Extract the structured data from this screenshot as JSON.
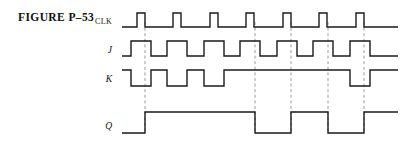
{
  "figure": {
    "caption": "FIGURE P–53",
    "background_color": "#ffffff",
    "wave_color": "#1a1a1a",
    "marker_color": "#9a9a9a",
    "width": 405,
    "height": 144
  },
  "signals": [
    {
      "name": "clk",
      "label": "CLK",
      "label_style": "upright",
      "label_x": 112,
      "label_y": 24
    },
    {
      "name": "j",
      "label": "J",
      "label_style": "italic",
      "label_x": 112,
      "label_y": 52
    },
    {
      "name": "k",
      "label": "K",
      "label_style": "italic",
      "label_x": 112,
      "label_y": 81
    },
    {
      "name": "q",
      "label": "Q",
      "label_style": "italic",
      "label_x": 112,
      "label_y": 128
    }
  ],
  "chart_data": {
    "type": "line",
    "subtitle": "JK flip-flop timing diagram",
    "xlabel": "",
    "ylabel": "",
    "grid": false,
    "legend_position": "left",
    "time_axis": {
      "x_start": 122,
      "x_end": 398,
      "clock_period_px": 36.4,
      "clock_pulse_width_px": 8,
      "first_clock_rise_px": 137
    },
    "levels": {
      "clk": {
        "low_y": 27,
        "high_y": 13
      },
      "j": {
        "low_y": 56,
        "high_y": 41
      },
      "k": {
        "low_y": 86,
        "high_y": 70
      },
      "q": {
        "low_y": 133,
        "high_y": 112
      }
    },
    "series": [
      {
        "name": "CLK",
        "description": "Eight narrow positive clock pulses, period 36.4 px, width 8 px",
        "transitions": [
          {
            "x": 122,
            "level": 0
          },
          {
            "x": 137,
            "level": 1
          },
          {
            "x": 145,
            "level": 0
          },
          {
            "x": 173,
            "level": 1
          },
          {
            "x": 181,
            "level": 0
          },
          {
            "x": 210,
            "level": 1
          },
          {
            "x": 218,
            "level": 0
          },
          {
            "x": 246,
            "level": 1
          },
          {
            "x": 254,
            "level": 0
          },
          {
            "x": 283,
            "level": 1
          },
          {
            "x": 291,
            "level": 0
          },
          {
            "x": 319,
            "level": 1
          },
          {
            "x": 327,
            "level": 0
          },
          {
            "x": 356,
            "level": 1
          },
          {
            "x": 364,
            "level": 0
          },
          {
            "x": 398,
            "level": 0
          }
        ]
      },
      {
        "name": "J",
        "description": "J pulses high across each clock edge except it stays low over the fourth, fifth and sixth edges region pattern",
        "transitions": [
          {
            "x": 122,
            "level": 0
          },
          {
            "x": 131,
            "level": 1
          },
          {
            "x": 151,
            "level": 0
          },
          {
            "x": 167,
            "level": 1
          },
          {
            "x": 187,
            "level": 0
          },
          {
            "x": 204,
            "level": 1
          },
          {
            "x": 224,
            "level": 0
          },
          {
            "x": 240,
            "level": 1
          },
          {
            "x": 260,
            "level": 0
          },
          {
            "x": 277,
            "level": 1
          },
          {
            "x": 297,
            "level": 0
          },
          {
            "x": 313,
            "level": 1
          },
          {
            "x": 333,
            "level": 0
          },
          {
            "x": 350,
            "level": 1
          },
          {
            "x": 370,
            "level": 0
          },
          {
            "x": 398,
            "level": 0
          }
        ]
      },
      {
        "name": "K",
        "description": "K starts high, three negative pulses at the first three clock edges, stays high, then one negative pulse at the last edge",
        "transitions": [
          {
            "x": 122,
            "level": 1
          },
          {
            "x": 131,
            "level": 0
          },
          {
            "x": 151,
            "level": 1
          },
          {
            "x": 167,
            "level": 0
          },
          {
            "x": 187,
            "level": 1
          },
          {
            "x": 204,
            "level": 0
          },
          {
            "x": 224,
            "level": 1
          },
          {
            "x": 350,
            "level": 0
          },
          {
            "x": 370,
            "level": 1
          },
          {
            "x": 398,
            "level": 1
          }
        ]
      },
      {
        "name": "Q",
        "description": "Q output of the JK flip-flop: sets on first edge, resets on fourth, sets on fifth, resets on sixth, sets on last",
        "transitions": [
          {
            "x": 122,
            "level": 0
          },
          {
            "x": 145,
            "level": 1
          },
          {
            "x": 255,
            "level": 0
          },
          {
            "x": 291,
            "level": 1
          },
          {
            "x": 328,
            "level": 0
          },
          {
            "x": 364,
            "level": 1
          },
          {
            "x": 398,
            "level": 1
          }
        ]
      }
    ],
    "markers": [
      {
        "name": "edge-marker-1",
        "x": 145,
        "y_top": 22,
        "y_bottom": 133
      },
      {
        "name": "edge-marker-2",
        "x": 255,
        "y_top": 22,
        "y_bottom": 133
      },
      {
        "name": "edge-marker-3",
        "x": 291,
        "y_top": 22,
        "y_bottom": 133
      },
      {
        "name": "edge-marker-4",
        "x": 328,
        "y_top": 22,
        "y_bottom": 133
      },
      {
        "name": "edge-marker-5",
        "x": 364,
        "y_top": 22,
        "y_bottom": 133
      }
    ]
  }
}
